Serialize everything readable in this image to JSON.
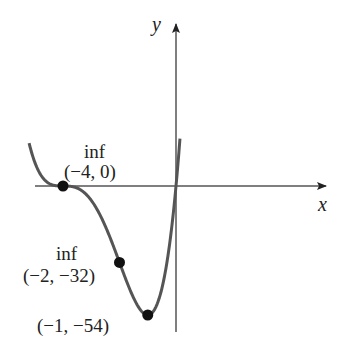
{
  "chart_data": {
    "type": "line",
    "title": "",
    "function": "f(x) = 2x(x+4)^3",
    "xlabel": "x",
    "ylabel": "y",
    "grid": false,
    "xlim": [
      -5.2,
      0.14
    ],
    "ylim": [
      -54,
      20
    ],
    "points": [
      {
        "x": -4,
        "y": 0,
        "label": "(−4, 0)",
        "note": "inf"
      },
      {
        "x": -2,
        "y": -32,
        "label": "(−2, −32)",
        "note": "inf"
      },
      {
        "x": -1,
        "y": -54,
        "label": "(−1, −54)",
        "note": ""
      }
    ],
    "curve_color": "#555555",
    "point_color": "#111111"
  },
  "labels": {
    "x_axis": "x",
    "y_axis": "y",
    "p1_note": "inf",
    "p1_coord": "(−4, 0)",
    "p2_note": "inf",
    "p2_coord": "(−2, −32)",
    "p3_coord": "(−1, −54)"
  }
}
